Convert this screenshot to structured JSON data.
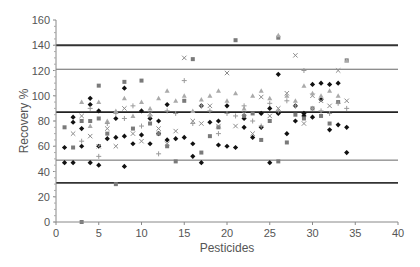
{
  "chart_data": {
    "type": "scatter",
    "title": "",
    "xlabel": "Pesticides",
    "ylabel": "Recovery %",
    "xlim": [
      0,
      40
    ],
    "ylim": [
      0,
      160
    ],
    "x_ticks": [
      0,
      5,
      10,
      15,
      20,
      25,
      30,
      35,
      40
    ],
    "y_ticks": [
      0,
      20,
      40,
      60,
      80,
      100,
      120,
      140,
      160
    ],
    "grid": false,
    "legend": null,
    "reference_lines": [
      {
        "y": 140,
        "style": "thick",
        "color": "#333333"
      },
      {
        "y": 121,
        "style": "thin",
        "color": "#666666"
      },
      {
        "y": 87,
        "style": "thick",
        "color": "#222222"
      },
      {
        "y": 49,
        "style": "thin",
        "color": "#666666"
      },
      {
        "y": 31,
        "style": "thick",
        "color": "#333333"
      }
    ],
    "series": [
      {
        "name": "series-diamond",
        "marker": "diamond",
        "color": "#111111",
        "points": [
          [
            1,
            59
          ],
          [
            1,
            47
          ],
          [
            2,
            47
          ],
          [
            2,
            79
          ],
          [
            2,
            83
          ],
          [
            3,
            60
          ],
          [
            3,
            74
          ],
          [
            4,
            47
          ],
          [
            4,
            93
          ],
          [
            4,
            98
          ],
          [
            5,
            45
          ],
          [
            5,
            60
          ],
          [
            5,
            88
          ],
          [
            6,
            66
          ],
          [
            7,
            67
          ],
          [
            7,
            82
          ],
          [
            8,
            68
          ],
          [
            8,
            44
          ],
          [
            8,
            106
          ],
          [
            9,
            62
          ],
          [
            10,
            69
          ],
          [
            10,
            88
          ],
          [
            11,
            62
          ],
          [
            11,
            82
          ],
          [
            12,
            70
          ],
          [
            12,
            80
          ],
          [
            13,
            93
          ],
          [
            13,
            65
          ],
          [
            14,
            66
          ],
          [
            15,
            67
          ],
          [
            16,
            62
          ],
          [
            16,
            52
          ],
          [
            17,
            47
          ],
          [
            17,
            92
          ],
          [
            18,
            79
          ],
          [
            19,
            80
          ],
          [
            19,
            61
          ],
          [
            20,
            92
          ],
          [
            20,
            60
          ],
          [
            21,
            59
          ],
          [
            22,
            75
          ],
          [
            22,
            82
          ],
          [
            23,
            67
          ],
          [
            24,
            86
          ],
          [
            24,
            75
          ],
          [
            25,
            47
          ],
          [
            25,
            90
          ],
          [
            26,
            86
          ],
          [
            26,
            117
          ],
          [
            27,
            70
          ],
          [
            28,
            80
          ],
          [
            28,
            92
          ],
          [
            29,
            84
          ],
          [
            29,
            86
          ],
          [
            30,
            83
          ],
          [
            30,
            109
          ],
          [
            31,
            97
          ],
          [
            31,
            110
          ],
          [
            32,
            73
          ],
          [
            32,
            109
          ],
          [
            33,
            77
          ],
          [
            33,
            110
          ],
          [
            34,
            75
          ],
          [
            34,
            55
          ]
        ]
      },
      {
        "name": "series-square",
        "marker": "square",
        "color": "#7a7a7a",
        "points": [
          [
            1,
            75
          ],
          [
            2,
            59
          ],
          [
            3,
            0
          ],
          [
            3,
            80
          ],
          [
            4,
            80
          ],
          [
            5,
            82
          ],
          [
            5,
            108
          ],
          [
            6,
            70
          ],
          [
            7,
            30
          ],
          [
            8,
            111
          ],
          [
            9,
            74
          ],
          [
            10,
            112
          ],
          [
            11,
            78
          ],
          [
            12,
            70
          ],
          [
            13,
            60
          ],
          [
            14,
            48
          ],
          [
            15,
            96
          ],
          [
            16,
            129
          ],
          [
            17,
            55
          ],
          [
            18,
            68
          ],
          [
            19,
            75
          ],
          [
            21,
            144
          ],
          [
            22,
            84
          ],
          [
            23,
            86
          ],
          [
            24,
            65
          ],
          [
            25,
            80
          ],
          [
            26,
            48
          ],
          [
            26,
            146
          ],
          [
            27,
            63
          ],
          [
            28,
            85
          ],
          [
            29,
            82
          ],
          [
            30,
            90
          ],
          [
            31,
            84
          ],
          [
            32,
            78
          ],
          [
            33,
            95
          ],
          [
            34,
            128
          ]
        ]
      },
      {
        "name": "series-x",
        "marker": "x",
        "color": "#8c8c8c",
        "points": [
          [
            2,
            70
          ],
          [
            3,
            84
          ],
          [
            4,
            68
          ],
          [
            5,
            60
          ],
          [
            6,
            74
          ],
          [
            7,
            60
          ],
          [
            8,
            90
          ],
          [
            9,
            70
          ],
          [
            10,
            64
          ],
          [
            11,
            86
          ],
          [
            12,
            74
          ],
          [
            13,
            62
          ],
          [
            14,
            72
          ],
          [
            15,
            130
          ],
          [
            16,
            80
          ],
          [
            17,
            78
          ],
          [
            18,
            92
          ],
          [
            19,
            76
          ],
          [
            20,
            118
          ],
          [
            21,
            76
          ],
          [
            22,
            86
          ],
          [
            23,
            70
          ],
          [
            24,
            99
          ],
          [
            25,
            84
          ],
          [
            26,
            90
          ],
          [
            27,
            102
          ],
          [
            28,
            132
          ],
          [
            29,
            78
          ],
          [
            30,
            100
          ],
          [
            31,
            96
          ],
          [
            32,
            92
          ],
          [
            33,
            120
          ],
          [
            34,
            96
          ]
        ]
      },
      {
        "name": "series-triangle",
        "marker": "triangle",
        "color": "#aaaaaa",
        "points": [
          [
            3,
            95
          ],
          [
            4,
            76
          ],
          [
            5,
            95
          ],
          [
            6,
            80
          ],
          [
            7,
            88
          ],
          [
            8,
            98
          ],
          [
            9,
            84
          ],
          [
            10,
            95
          ],
          [
            11,
            90
          ],
          [
            12,
            98
          ],
          [
            13,
            104
          ],
          [
            14,
            96
          ],
          [
            15,
            100
          ],
          [
            16,
            88
          ],
          [
            17,
            97
          ],
          [
            18,
            100
          ],
          [
            19,
            104
          ],
          [
            20,
            96
          ],
          [
            21,
            102
          ],
          [
            22,
            90
          ],
          [
            23,
            100
          ],
          [
            24,
            104
          ],
          [
            25,
            98
          ],
          [
            26,
            148
          ],
          [
            27,
            100
          ],
          [
            28,
            96
          ],
          [
            29,
            108
          ],
          [
            30,
            102
          ],
          [
            31,
            100
          ],
          [
            32,
            104
          ],
          [
            33,
            100
          ],
          [
            34,
            128
          ]
        ]
      },
      {
        "name": "series-plus",
        "marker": "plus",
        "color": "#9a9a9a",
        "points": [
          [
            3,
            64
          ],
          [
            4,
            90
          ],
          [
            5,
            52
          ],
          [
            6,
            78
          ],
          [
            7,
            86
          ],
          [
            8,
            82
          ],
          [
            9,
            92
          ],
          [
            10,
            76
          ],
          [
            11,
            84
          ],
          [
            12,
            54
          ],
          [
            13,
            88
          ],
          [
            14,
            86
          ],
          [
            15,
            112
          ],
          [
            16,
            78
          ],
          [
            17,
            92
          ],
          [
            18,
            88
          ],
          [
            19,
            70
          ],
          [
            20,
            86
          ],
          [
            21,
            84
          ],
          [
            22,
            92
          ],
          [
            23,
            80
          ],
          [
            24,
            76
          ],
          [
            25,
            94
          ],
          [
            26,
            88
          ],
          [
            27,
            96
          ],
          [
            28,
            92
          ],
          [
            29,
            120
          ],
          [
            30,
            90
          ],
          [
            31,
            88
          ],
          [
            32,
            86
          ],
          [
            33,
            94
          ],
          [
            34,
            90
          ]
        ]
      }
    ]
  }
}
